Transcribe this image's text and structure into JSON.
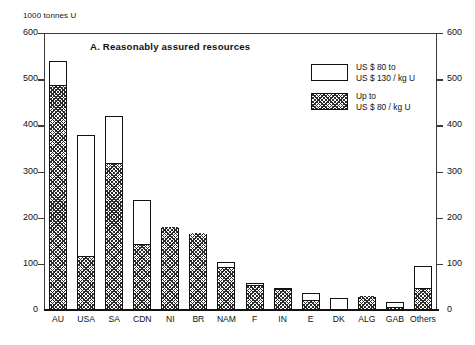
{
  "chart_data": {
    "type": "bar",
    "title": "A.   Reasonably assured resources",
    "ylabel": "1000 tonnes U",
    "xlabel": "",
    "ylim": [
      0,
      600
    ],
    "yticks": [
      0,
      100,
      200,
      300,
      400,
      500,
      600
    ],
    "grid": false,
    "stacked": true,
    "dual_axis": true,
    "legend_position": "top-right",
    "categories": [
      "AU",
      "USA",
      "SA",
      "CDN",
      "NI",
      "BR",
      "NAM",
      "F",
      "IN",
      "E",
      "DK",
      "ALG",
      "GAB",
      "Others"
    ],
    "series": [
      {
        "name": "Up to US $ 80 / kg U",
        "fill": "hatched",
        "values": [
          485,
          115,
          316,
          140,
          177,
          165,
          92,
          52,
          44,
          20,
          0,
          28,
          5,
          45
        ]
      },
      {
        "name": "US $ 80 to US $ 130 / kg U",
        "fill": "white",
        "values": [
          55,
          265,
          104,
          98,
          0,
          0,
          13,
          6,
          4,
          16,
          27,
          0,
          13,
          50
        ]
      }
    ],
    "totals": [
      540,
      380,
      420,
      238,
      177,
      165,
      105,
      58,
      48,
      36,
      27,
      28,
      18,
      95
    ]
  },
  "legend": {
    "entries": [
      {
        "line1": "US $ 80 to",
        "line2": "US $ 130 / kg U",
        "swatch": "white"
      },
      {
        "line1": "Up to",
        "line2": "US $ 80 / kg U",
        "swatch": "hatched"
      }
    ]
  },
  "colors": {
    "axis": "#3a3a3a",
    "bar_outline": "#111111",
    "hatch": "#2a2a2a",
    "background": "#ffffff",
    "text": "#111111"
  }
}
